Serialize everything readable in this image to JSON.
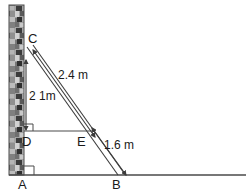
{
  "figure": {
    "background_color": "#ffffff",
    "line_color": "#3c3c3c",
    "ground_color": "#4a4a4a",
    "wall": {
      "name": "textured vertical wall",
      "fill_color": "#9a9a9a",
      "x": 9,
      "y": 5,
      "width": 15,
      "height": 170
    },
    "points": [
      {
        "id": "C",
        "label": "C",
        "x": 26,
        "y": 45,
        "label_x": 28,
        "label_y": 43
      },
      {
        "id": "D",
        "label": "D",
        "x": 26,
        "y": 131,
        "label_x": 22,
        "label_y": 146
      },
      {
        "id": "E",
        "label": "E",
        "x": 82,
        "y": 131,
        "label_x": 78,
        "label_y": 146
      },
      {
        "id": "A",
        "label": "A",
        "x": 24,
        "y": 175,
        "label_x": 19,
        "label_y": 189
      },
      {
        "id": "B",
        "label": "B",
        "x": 117,
        "y": 175,
        "label_x": 113,
        "label_y": 189
      }
    ],
    "measurements": [
      {
        "id": "height-CD",
        "label": "2 1m",
        "label_x": 29,
        "label_y": 100,
        "orientation": "vertical",
        "from": "C",
        "to": "D",
        "arrow": "double"
      },
      {
        "id": "ladder-upper-CE",
        "label": "2.4 m",
        "label_x": 62,
        "label_y": 77,
        "orientation": "diagonal",
        "from": "C",
        "to": "E",
        "arrow": "double"
      },
      {
        "id": "ladder-lower-EB",
        "label": "1.6 m",
        "label_x": 107,
        "label_y": 148,
        "orientation": "diagonal",
        "from": "E",
        "to": "B",
        "arrow": "double"
      }
    ],
    "right_angles": [
      {
        "id": "right-angle-at-D",
        "x": 26,
        "y": 131,
        "size": 7
      },
      {
        "id": "right-angle-at-A",
        "x": 24,
        "y": 175,
        "size": 9
      }
    ],
    "ground": {
      "name": "ground line",
      "x1": 9,
      "x2": 246,
      "y": 175
    }
  }
}
